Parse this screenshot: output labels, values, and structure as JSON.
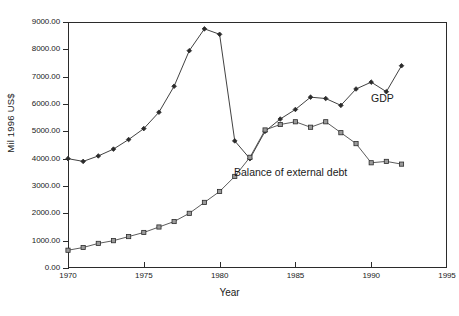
{
  "chart_data": {
    "type": "line",
    "title": "",
    "xlabel": "Year",
    "ylabel": "Mil 1996 US$",
    "xlim": [
      1970,
      1995
    ],
    "ylim": [
      0,
      9000
    ],
    "grid": false,
    "legend_position": "inline-annotations",
    "x_ticks": [
      "1970",
      "1975",
      "1980",
      "1985",
      "1990",
      "1995"
    ],
    "x_tick_values": [
      1970,
      1975,
      1980,
      1985,
      1990,
      1995
    ],
    "y_ticks": [
      "0.00",
      "1000.00",
      "2000.00",
      "3000.00",
      "4000.00",
      "5000.00",
      "6000.00",
      "7000.00",
      "8000.00",
      "9000.00"
    ],
    "y_tick_values": [
      0,
      1000,
      2000,
      3000,
      4000,
      5000,
      6000,
      7000,
      8000,
      9000
    ],
    "x": [
      1970,
      1971,
      1972,
      1973,
      1974,
      1975,
      1976,
      1977,
      1978,
      1979,
      1980,
      1981,
      1982,
      1983,
      1984,
      1985,
      1986,
      1987,
      1988,
      1989,
      1990,
      1991,
      1992
    ],
    "series": [
      {
        "name": "GDP",
        "marker": "filled-diamond",
        "color": "#2b2b2b",
        "values": [
          4000,
          3900,
          4100,
          4350,
          4700,
          5100,
          5700,
          6650,
          7950,
          8750,
          8550,
          4650,
          4000,
          5000,
          5450,
          5800,
          6250,
          6200,
          5950,
          6550,
          6800,
          6450,
          7400
        ]
      },
      {
        "name": "Balance of external debt",
        "marker": "open-square",
        "color": "#4a4a4a",
        "values": [
          650,
          750,
          900,
          1000,
          1150,
          1300,
          1500,
          1700,
          2000,
          2400,
          2800,
          3350,
          4050,
          5050,
          5250,
          5350,
          5150,
          5350,
          4950,
          4550,
          3850,
          3900,
          3800
        ]
      }
    ],
    "annotations": [
      {
        "text": "GDP",
        "x": 1991,
        "y": 6000
      },
      {
        "text": "Balance of external debt",
        "x": 1982.5,
        "y": 3300
      }
    ]
  }
}
